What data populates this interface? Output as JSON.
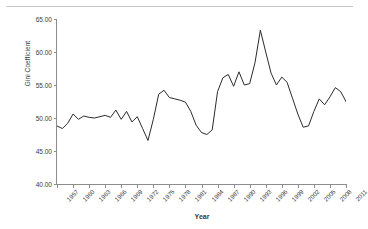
{
  "chart_data": {
    "type": "line",
    "title": "",
    "xlabel": "Year",
    "ylabel": "Gini Coefficient",
    "xlim": [
      1957,
      2011
    ],
    "ylim": [
      40.0,
      65.0
    ],
    "yticks": [
      "40.00",
      "45.00",
      "50.00",
      "55.00",
      "60.00",
      "65.00"
    ],
    "ytick_values": [
      40.0,
      45.0,
      50.0,
      55.0,
      60.0,
      65.0
    ],
    "xticks": [
      "1957",
      "1960",
      "1963",
      "1966",
      "1969",
      "1972",
      "1975",
      "1978",
      "1981",
      "1984",
      "1987",
      "1990",
      "1993",
      "1996",
      "1999",
      "2002",
      "2005",
      "2008",
      "2011"
    ],
    "xtick_values": [
      1957,
      1960,
      1963,
      1966,
      1969,
      1972,
      1975,
      1978,
      1981,
      1984,
      1987,
      1990,
      1993,
      1996,
      1999,
      2002,
      2005,
      2008,
      2011
    ],
    "grid": false,
    "legend": false,
    "line_color": "#2b2b2b",
    "series": [
      {
        "name": "Gini Coefficient",
        "x": [
          1957,
          1958,
          1959,
          1960,
          1961,
          1962,
          1963,
          1964,
          1965,
          1966,
          1967,
          1968,
          1969,
          1970,
          1971,
          1972,
          1973,
          1974,
          1975,
          1976,
          1977,
          1978,
          1979,
          1980,
          1981,
          1982,
          1983,
          1984,
          1985,
          1986,
          1987,
          1988,
          1989,
          1990,
          1991,
          1992,
          1993,
          1994,
          1995,
          1996,
          1997,
          1998,
          1999,
          2000,
          2001,
          2002,
          2003,
          2004,
          2005,
          2006,
          2007,
          2008,
          2009,
          2010,
          2011
        ],
        "values": [
          48.8,
          48.4,
          49.2,
          50.6,
          49.8,
          50.3,
          50.1,
          50.0,
          50.2,
          50.4,
          50.1,
          51.2,
          49.8,
          51.0,
          49.4,
          50.2,
          48.4,
          46.6,
          49.8,
          53.6,
          54.2,
          53.1,
          52.9,
          52.7,
          52.4,
          51.0,
          48.9,
          47.8,
          47.5,
          48.2,
          54.0,
          56.1,
          56.6,
          54.8,
          57.0,
          55.0,
          55.2,
          58.4,
          63.3,
          60.0,
          56.8,
          55.0,
          56.2,
          55.4,
          53.0,
          50.6,
          48.6,
          48.8,
          51.0,
          52.9,
          52.0,
          53.2,
          54.6,
          54.0,
          52.5
        ]
      }
    ],
    "notes": {
      "max_value": 63.3,
      "max_year": 1995,
      "min_value": 46.6,
      "min_year": 1974
    }
  },
  "axis": {
    "y_title": "Gini Coefficient",
    "x_title": "Year"
  }
}
